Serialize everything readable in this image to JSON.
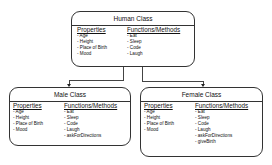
{
  "diagram": {
    "type": "class-hierarchy",
    "classes": {
      "human": {
        "title": "Human Class",
        "properties_label": "Properties",
        "methods_label": "Functions/Methods",
        "properties": [
          "Age",
          "Height",
          "Place of Birth",
          "Mood"
        ],
        "methods": [
          "Eat",
          "Sleep",
          "Code",
          "Laugh"
        ]
      },
      "male": {
        "title": "Male Class",
        "properties_label": "Properties",
        "methods_label": "Functions/Methods",
        "properties": [
          "Age",
          "Height",
          "Place of Birth",
          "Mood"
        ],
        "methods": [
          "Eat",
          "Sleep",
          "Code",
          "Laugh",
          "askForDirections"
        ]
      },
      "female": {
        "title": "Female Class",
        "properties_label": "Properties",
        "methods_label": "Functions/Methods",
        "properties": [
          "Age",
          "Height",
          "Place of Birth",
          "Mood"
        ],
        "methods": [
          "Eat",
          "Sleep",
          "Code",
          "Laugh",
          "askForDirections",
          "giveBirth"
        ]
      }
    },
    "edges": [
      {
        "from": "Human Class",
        "to": "Male Class"
      },
      {
        "from": "Human Class",
        "to": "Female Class"
      }
    ]
  }
}
